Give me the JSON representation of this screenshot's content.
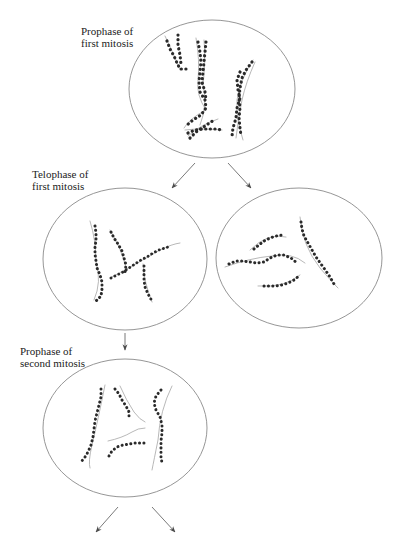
{
  "diagram": {
    "colors": {
      "outline": "#8a8a8a",
      "chromosome": "#2a2a2a",
      "thread": "#9a9a9a",
      "arrow": "#6a6a6a",
      "text": "#222222"
    },
    "stages": [
      {
        "id": "prophase-first",
        "label_line1": "Prophase of",
        "label_line2": "first mitosis",
        "cell": {
          "cx": 212,
          "cy": 89,
          "rx": 83,
          "ry": 69
        }
      },
      {
        "id": "telophase-first-left",
        "label_line1": "Telophase of",
        "label_line2": "first mitosis",
        "cell": {
          "cx": 125,
          "cy": 259,
          "rx": 82,
          "ry": 71
        }
      },
      {
        "id": "telophase-first-right",
        "label_line1": "",
        "label_line2": "",
        "cell": {
          "cx": 299,
          "cy": 258,
          "rx": 83,
          "ry": 70
        }
      },
      {
        "id": "prophase-second",
        "label_line1": "Prophase of",
        "label_line2": "second mitosis",
        "cell": {
          "cx": 125,
          "cy": 428,
          "rx": 82,
          "ry": 69
        }
      }
    ],
    "arrows": [
      {
        "from": [
          195,
          163
        ],
        "to": [
          172,
          188
        ]
      },
      {
        "from": [
          228,
          163
        ],
        "to": [
          251,
          188
        ]
      },
      {
        "from": [
          125,
          333
        ],
        "to": [
          125,
          350
        ]
      },
      {
        "from": [
          118,
          507
        ],
        "to": [
          96,
          532
        ]
      },
      {
        "from": [
          152,
          507
        ],
        "to": [
          175,
          532
        ]
      }
    ]
  }
}
